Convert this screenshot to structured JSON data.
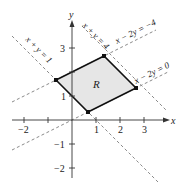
{
  "figure": {
    "type": "region-plot",
    "axes": {
      "x_label": "x",
      "y_label": "y",
      "x_ticks": [
        "−2",
        "−1",
        "1",
        "2",
        "3"
      ],
      "y_ticks": [
        "3",
        "1",
        "−1",
        "−2"
      ],
      "x_range": [
        -3,
        4
      ],
      "y_range": [
        -3,
        4
      ]
    },
    "region": {
      "label": "R",
      "vertices": [
        [
          -0.667,
          1.667
        ],
        [
          1.333,
          2.667
        ],
        [
          2.667,
          1.333
        ],
        [
          0.667,
          0.333
        ]
      ],
      "fill_color": "#e6e6e6",
      "stroke_color": "#111111"
    },
    "lines": [
      {
        "equation": "x + y = 1",
        "label": "x + y = 1"
      },
      {
        "equation": "x + y = 4",
        "label": "x + y = 4"
      },
      {
        "equation": "x − 2y = 0",
        "label": "x − 2y = 0"
      },
      {
        "equation": "x − 2y = −4",
        "label": "x − 2y = −4"
      }
    ],
    "dash_color": "#888888"
  }
}
